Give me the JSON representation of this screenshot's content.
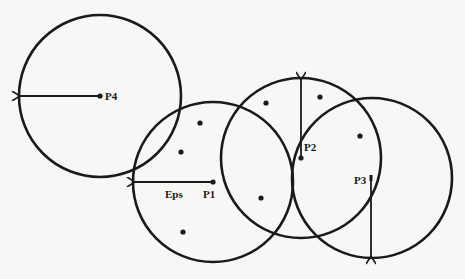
{
  "diagram": {
    "stroke_color": "#1a1a1a",
    "background": "#f7f7f5",
    "circles": [
      {
        "id": "P4",
        "label": "P4",
        "cx": 100,
        "cy": 96,
        "r": 81,
        "arrow": "left"
      },
      {
        "id": "P1",
        "label": "P1",
        "cx": 213,
        "cy": 182,
        "r": 80,
        "arrow": "left",
        "arrow_label": "Eps"
      },
      {
        "id": "P2",
        "label": "P2",
        "cx": 301,
        "cy": 158,
        "r": 80,
        "arrow": "up"
      },
      {
        "id": "P3",
        "label": "P3",
        "cx": 372,
        "cy": 178,
        "r": 80,
        "arrow": "down"
      }
    ],
    "labels": {
      "p1": "P1",
      "p2": "P2",
      "p3": "P3",
      "p4": "P4",
      "eps": "Eps"
    },
    "extra_points": [
      [
        200,
        123
      ],
      [
        181,
        152
      ],
      [
        183,
        232
      ],
      [
        261,
        198
      ],
      [
        266,
        103
      ],
      [
        320,
        97
      ],
      [
        360,
        136
      ]
    ]
  }
}
